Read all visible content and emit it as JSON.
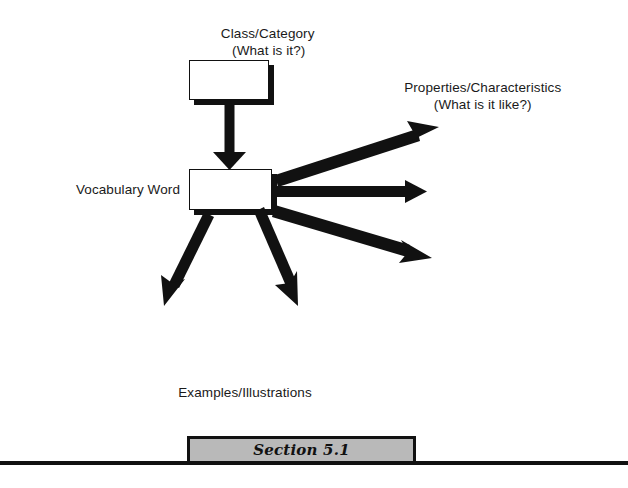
{
  "document": {
    "type": "concept-map-worksheet",
    "background_color": "#ffffff",
    "ink_color": "#111111"
  },
  "diagram": {
    "title_label": {
      "line1": "Class/Category",
      "line2": "(What is it?)"
    },
    "properties_label": {
      "line1": "Properties/Characteristics",
      "line2": "(What is it like?)"
    },
    "vocabulary_label": "Vocabulary Word",
    "examples_label": "Examples/Illustrations",
    "boxes": [
      {
        "name": "class-category-box",
        "text": ""
      },
      {
        "name": "vocabulary-word-box",
        "text": ""
      }
    ],
    "arrows": [
      {
        "name": "arrow-down-to-vocabulary",
        "direction": "down"
      },
      {
        "name": "arrow-property-1",
        "direction": "right-up"
      },
      {
        "name": "arrow-property-2",
        "direction": "right"
      },
      {
        "name": "arrow-property-3",
        "direction": "right-down"
      },
      {
        "name": "arrow-example-1",
        "direction": "down-left"
      },
      {
        "name": "arrow-example-2",
        "direction": "down-right"
      }
    ]
  },
  "footer": {
    "section_label": "Section 5.1",
    "banner_fill_color": "#b9b9b9",
    "banner_border_color": "#111111"
  }
}
